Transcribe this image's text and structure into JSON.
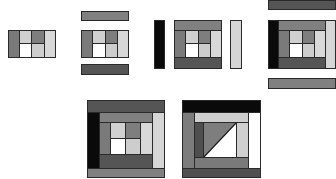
{
  "colors": {
    "black": "#0a0a0a",
    "dark": "#4a4a4a",
    "darkmid": "#5e5e5e",
    "mid": "#7a7a7a",
    "midlight": "#8c8c8c",
    "light": "#c8c8c8",
    "verylight": "#d8d8d8",
    "white": "#ffffff",
    "outline": "#2a2a2a"
  },
  "figures": [
    {
      "id": "step-1",
      "description": "Center 2x2 block with first side strips"
    },
    {
      "id": "step-2",
      "description": "Block with top and bottom strips placed"
    },
    {
      "id": "step-3",
      "description": "Block with left and right strips placed"
    },
    {
      "id": "step-4",
      "description": "Larger block with top and bottom strips placed"
    },
    {
      "id": "step-5",
      "description": "Completed log cabin block"
    },
    {
      "id": "step-6",
      "description": "Variation block with diagonal split center"
    }
  ]
}
